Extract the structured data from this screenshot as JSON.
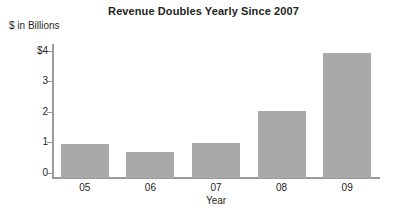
{
  "chart_data": {
    "type": "bar",
    "title": "Revenue Doubles Yearly Since 2007",
    "xlabel": "Year",
    "ylabel": "$ in Billions",
    "categories": [
      "05",
      "06",
      "07",
      "08",
      "09"
    ],
    "values": [
      1.12,
      0.85,
      1.13,
      2.18,
      4.1
    ],
    "ylim": [
      0,
      4.35
    ],
    "yticks": [
      0,
      1,
      2,
      3,
      4
    ],
    "ytick_labels": [
      "0",
      "1",
      "2",
      "3",
      "$4"
    ],
    "grid": false,
    "legend": false,
    "bar_color": "#a9a9a9",
    "axis_color": "#9a9a9a",
    "text_color": "#231f20",
    "background": "#ffffff"
  }
}
